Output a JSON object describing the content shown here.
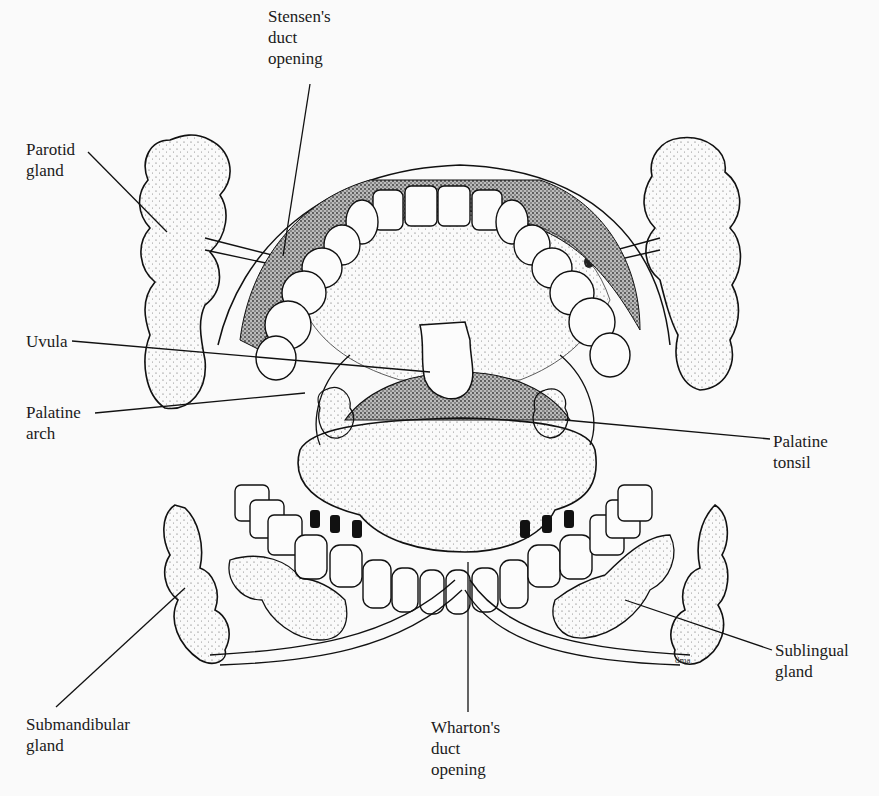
{
  "diagram": {
    "artist_mark": "dma",
    "labels": [
      {
        "id": "stensens-duct-opening",
        "lines": [
          "Stensen's",
          "duct",
          "opening"
        ],
        "x": 268,
        "y": 6
      },
      {
        "id": "parotid-gland",
        "lines": [
          "Parotid",
          "gland"
        ],
        "x": 26,
        "y": 139
      },
      {
        "id": "uvula",
        "lines": [
          "Uvula"
        ],
        "x": 26,
        "y": 331
      },
      {
        "id": "palatine-arch",
        "lines": [
          "Palatine",
          "arch"
        ],
        "x": 26,
        "y": 402
      },
      {
        "id": "palatine-tonsil",
        "lines": [
          "Palatine",
          "tonsil"
        ],
        "x": 773,
        "y": 431
      },
      {
        "id": "sublingual-gland",
        "lines": [
          "Sublingual",
          "gland"
        ],
        "x": 775,
        "y": 640
      },
      {
        "id": "submandibular-gland",
        "lines": [
          "Submandibular",
          "gland"
        ],
        "x": 26,
        "y": 714
      },
      {
        "id": "whartons-duct-opening",
        "lines": [
          "Wharton's",
          "duct",
          "opening"
        ],
        "x": 431,
        "y": 717
      }
    ]
  }
}
